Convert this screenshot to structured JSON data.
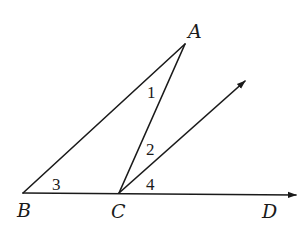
{
  "diagram": {
    "type": "geometry",
    "points": {
      "A": {
        "label": "A",
        "x": 185,
        "y": 44,
        "lx": 188,
        "ly": 38
      },
      "B": {
        "label": "B",
        "x": 23,
        "y": 193,
        "lx": 17,
        "ly": 217
      },
      "C": {
        "label": "C",
        "x": 119,
        "y": 193,
        "lx": 111,
        "ly": 218
      },
      "D": {
        "label": "D",
        "lx": 262,
        "ly": 218
      }
    },
    "ray_E_tip": {
      "x": 245,
      "y": 81
    },
    "ray_D_tip": {
      "x": 296,
      "y": 195
    },
    "angle_labels": [
      {
        "text": "1",
        "x": 147,
        "y": 98
      },
      {
        "text": "2",
        "x": 146,
        "y": 155
      },
      {
        "text": "3",
        "x": 52,
        "y": 190
      },
      {
        "text": "4",
        "x": 146,
        "y": 190
      }
    ],
    "colors": {
      "stroke": "#1a1a1a",
      "background": "#ffffff"
    }
  }
}
